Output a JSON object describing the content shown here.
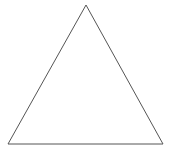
{
  "diagram": {
    "type": "geometric-shape",
    "shape": "triangle",
    "vertices": {
      "apex": [
        86,
        5
      ],
      "bottom_left": [
        8,
        144
      ],
      "bottom_right": [
        163,
        144
      ]
    },
    "stroke_color": "#555555",
    "fill_color": "none",
    "background_color": "#ffffff",
    "stroke_width": 1
  }
}
